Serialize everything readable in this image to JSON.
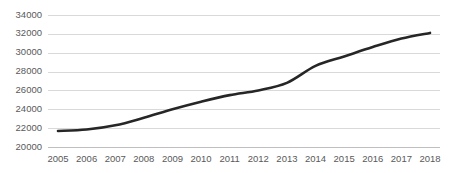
{
  "chart_data": {
    "type": "line",
    "title": "",
    "subtitle": "",
    "xlabel": "",
    "ylabel": "",
    "categories": [
      "2005",
      "2006",
      "2007",
      "2008",
      "2009",
      "2010",
      "2011",
      "2012",
      "2013",
      "2014",
      "2015",
      "2016",
      "2017",
      "2018"
    ],
    "values": [
      21700,
      21850,
      22300,
      23100,
      24000,
      24800,
      25500,
      26000,
      26800,
      28600,
      29600,
      30600,
      31500,
      32100
    ],
    "series": [
      {
        "name": "",
        "values": [
          21700,
          21850,
          22300,
          23100,
          24000,
          24800,
          25500,
          26000,
          26800,
          28600,
          29600,
          30600,
          31500,
          32100
        ]
      }
    ],
    "ylim": [
      20000,
      34000
    ],
    "ytick_labels": [
      "20000",
      "22000",
      "24000",
      "26000",
      "28000",
      "30000",
      "32000",
      "34000"
    ],
    "ytick_values": [
      20000,
      22000,
      24000,
      26000,
      28000,
      30000,
      32000,
      34000
    ],
    "ytick_step": 2000,
    "xtick_labels": [
      "2005",
      "2006",
      "2007",
      "2008",
      "2009",
      "2010",
      "2011",
      "2012",
      "2013",
      "2014",
      "2015",
      "2016",
      "2017",
      "2018"
    ],
    "grid": "horizontal",
    "legend": "none",
    "line_color": "#262626",
    "grid_color": "#d9d9d9",
    "axis_color": "#bfbfbf",
    "tick_label_color": "#595959",
    "background_color": "#ffffff",
    "annotations": []
  }
}
